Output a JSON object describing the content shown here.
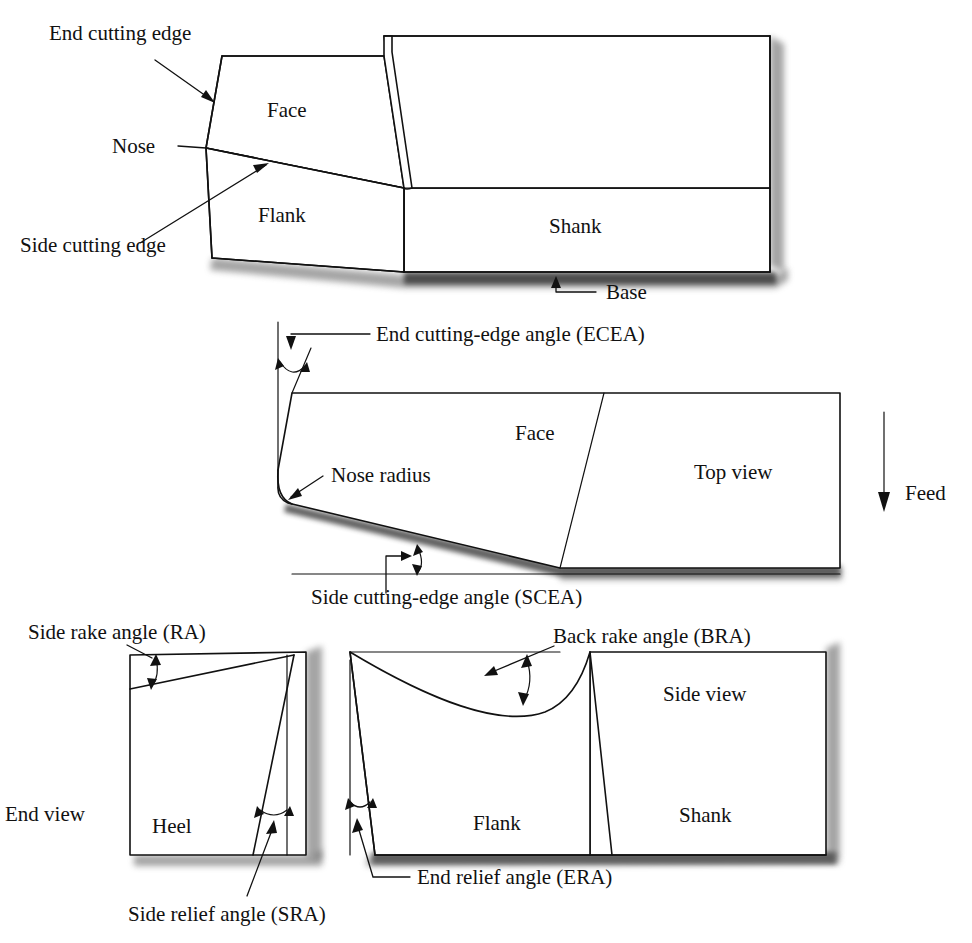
{
  "figure": {
    "background_color": "#ffffff",
    "line_color": "#111111"
  },
  "isometric_view": {
    "name": "isometric-tool-view",
    "labels": {
      "end_cutting_edge": "End cutting edge",
      "nose": "Nose",
      "side_cutting_edge": "Side cutting edge",
      "face": "Face",
      "flank": "Flank",
      "shank": "Shank",
      "base": "Base"
    }
  },
  "top_view": {
    "name": "top-view",
    "labels": {
      "ecea": "End cutting-edge angle (ECEA)",
      "nose_radius": "Nose radius",
      "face": "Face",
      "top_view": "Top view",
      "feed": "Feed",
      "scea": "Side cutting-edge angle (SCEA)"
    }
  },
  "end_view": {
    "name": "end-view",
    "labels": {
      "side_rake_angle": "Side rake angle (RA)",
      "end_view": "End view",
      "heel": "Heel",
      "side_relief_angle": "Side relief angle (SRA)"
    }
  },
  "side_view": {
    "name": "side-view",
    "labels": {
      "back_rake_angle": "Back rake angle (BRA)",
      "side_view": "Side view",
      "flank": "Flank",
      "shank": "Shank",
      "end_relief_angle": "End relief angle (ERA)"
    }
  }
}
